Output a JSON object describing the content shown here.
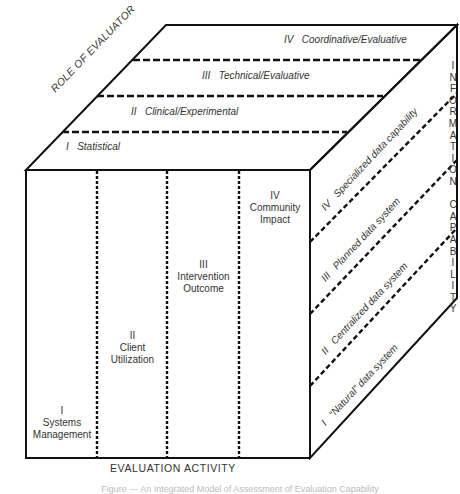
{
  "diagram": {
    "type": "3d-cube-matrix",
    "axes": {
      "top_face_axis": "ROLE OF EVALUATOR",
      "front_face_axis": "EVALUATION ACTIVITY",
      "right_face_axis": "INFORMATION CAPABILITY"
    },
    "role_of_evaluator": [
      {
        "numeral": "I",
        "label": "Statistical"
      },
      {
        "numeral": "II",
        "label": "Clinical/Experimental"
      },
      {
        "numeral": "III",
        "label": "Technical/Evaluative"
      },
      {
        "numeral": "IV",
        "label": "Coordinative/Evaluative"
      }
    ],
    "evaluation_activity": [
      {
        "numeral": "I",
        "label_line1": "Systems",
        "label_line2": "Management"
      },
      {
        "numeral": "II",
        "label_line1": "Client",
        "label_line2": "Utilization"
      },
      {
        "numeral": "III",
        "label_line1": "Intervention",
        "label_line2": "Outcome"
      },
      {
        "numeral": "IV",
        "label_line1": "Community",
        "label_line2": "Impact"
      }
    ],
    "information_capability": [
      {
        "numeral": "I",
        "label": "“Natural” data system"
      },
      {
        "numeral": "II",
        "label": "Centralized data system"
      },
      {
        "numeral": "III",
        "label": "Planned data system"
      },
      {
        "numeral": "IV",
        "label": "Specialized data capability"
      }
    ],
    "information_capability_letters": [
      "I",
      "N",
      "F",
      "O",
      "R",
      "M",
      "A",
      "T",
      "I",
      "O",
      "N",
      " ",
      "C",
      "A",
      "P",
      "A",
      "B",
      "I",
      "L",
      "I",
      "T",
      "Y"
    ],
    "caption": "Figure — An Integrated Model of Assessment of Evaluation Capability"
  },
  "colors": {
    "line": "#111111",
    "text": "#333333",
    "background": "#ffffff"
  }
}
